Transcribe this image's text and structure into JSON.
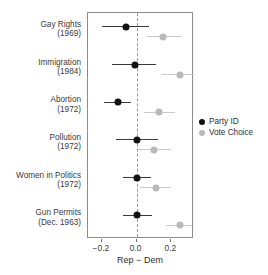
{
  "chart_data": {
    "type": "scatter",
    "title": "",
    "xlabel": "Rep − Dem",
    "ylabel": "",
    "xlim": [
      -0.28,
      0.33
    ],
    "xticks": [
      -0.2,
      0.0,
      0.2
    ],
    "xticklabels": [
      "−0.2",
      "0.0",
      "0.2"
    ],
    "grid": false,
    "zero_reference_line": 0.0,
    "legend_position": "right",
    "categories": [
      "Gay Rights (1969)",
      "Immigration (1984)",
      "Abortion (1972)",
      "Pollution (1972)",
      "Women in Politics (1972)",
      "Gun Permits (Dec. 1963)"
    ],
    "series": [
      {
        "name": "Party ID",
        "color": "#111111",
        "values": [
          -0.06,
          -0.01,
          -0.11,
          0.0,
          0.0,
          0.0
        ],
        "ci_low": [
          -0.2,
          -0.14,
          -0.19,
          -0.12,
          -0.08,
          -0.08
        ],
        "ci_high": [
          0.07,
          0.11,
          -0.03,
          0.12,
          0.08,
          0.09
        ]
      },
      {
        "name": "Vote Choice",
        "color": "#b9b9b9",
        "values": [
          0.15,
          0.25,
          0.13,
          0.1,
          0.11,
          0.25
        ],
        "ci_low": [
          0.06,
          0.14,
          0.04,
          0.01,
          0.02,
          0.17
        ],
        "ci_high": [
          0.26,
          0.33,
          0.22,
          0.2,
          0.2,
          0.32
        ]
      }
    ]
  },
  "rows": [
    {
      "issue": "Gay Rights",
      "year": "(1969)"
    },
    {
      "issue": "Immigration",
      "year": "(1984)"
    },
    {
      "issue": "Abortion",
      "year": "(1972)"
    },
    {
      "issue": "Pollution",
      "year": "(1972)"
    },
    {
      "issue": "Women in Politics",
      "year": "(1972)"
    },
    {
      "issue": "Gun Permits",
      "year": "(Dec. 1963)"
    }
  ],
  "axis": {
    "title": "Rep − Dem",
    "tick_labels": [
      "−0.2",
      "0.0",
      "0.2"
    ]
  },
  "legend": {
    "items": [
      {
        "label": "Party ID",
        "color": "#111111"
      },
      {
        "label": "Vote Choice",
        "color": "#b9b9b9"
      }
    ]
  }
}
